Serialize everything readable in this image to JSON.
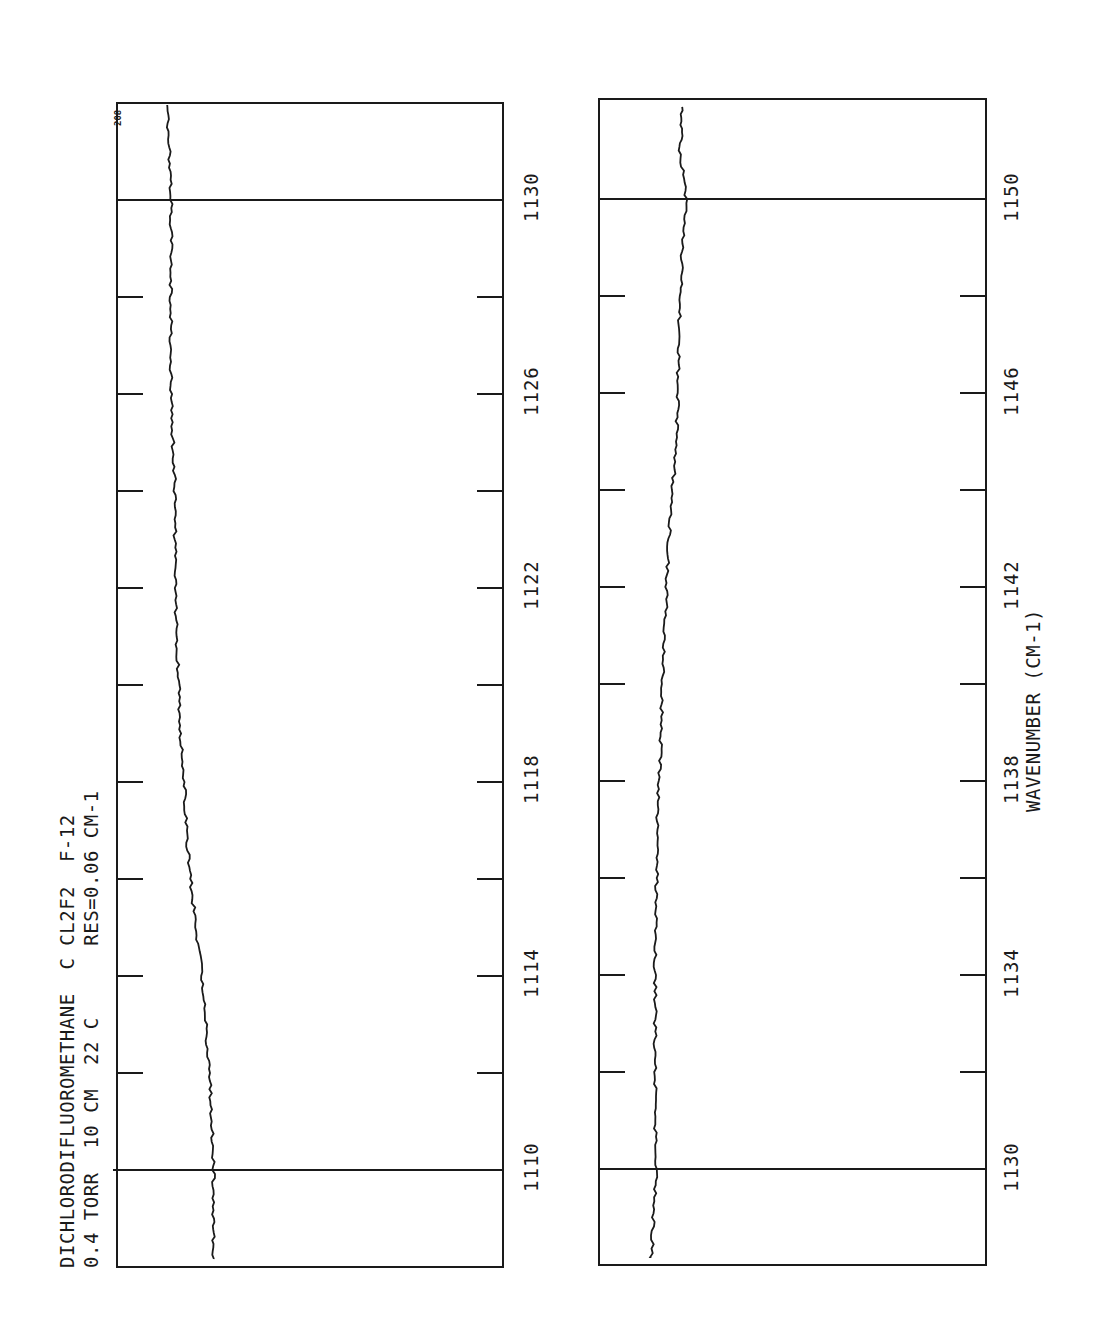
{
  "header": {
    "line1": "DICHLORODIFLUOROMETHANE  C CL2F2  F-12",
    "line2": "0.4 TORR  10 CM  22 C      RES=0.06 CM-1",
    "page_number": "208"
  },
  "axis": {
    "xlabel": "WAVENUMBER (CM-1)"
  },
  "panels": [
    {
      "range": [
        1110,
        1130
      ],
      "tick_labels": [
        "1110",
        "1114",
        "1118",
        "1122",
        "1126",
        "1130"
      ]
    },
    {
      "range": [
        1130,
        1150
      ],
      "tick_labels": [
        "1130",
        "1134",
        "1138",
        "1142",
        "1146",
        "1150"
      ]
    }
  ],
  "colors": {
    "ink": "#1a1a1a",
    "background": "#ffffff"
  },
  "chart_data": [
    {
      "type": "line",
      "title": "DICHLORODIFLUOROMETHANE C CL2F2 F-12 — 0.4 TORR 10 CM 22 C RES=0.06 CM-1",
      "xlabel": "WAVENUMBER (CM-1)",
      "ylabel": "Transmittance (relative)",
      "xlim": [
        1108.1,
        1132.0
      ],
      "ylim": [
        0,
        1
      ],
      "grid": false,
      "orientation": "rotated-90",
      "tick_labels": [
        "1110",
        "1114",
        "1118",
        "1122",
        "1126",
        "1130"
      ],
      "minor_tick_step": 2,
      "series": [
        {
          "name": "CCl2F2 transmittance",
          "x": [
            1108.1,
            1109,
            1110,
            1111,
            1112,
            1113,
            1114,
            1115,
            1116,
            1117,
            1118,
            1119,
            1120,
            1121,
            1122,
            1123,
            1124,
            1125,
            1126,
            1127,
            1128,
            1129,
            1130,
            1131,
            1132
          ],
          "values": [
            0.25,
            0.25,
            0.25,
            0.245,
            0.24,
            0.23,
            0.22,
            0.205,
            0.19,
            0.18,
            0.175,
            0.165,
            0.16,
            0.155,
            0.15,
            0.15,
            0.15,
            0.145,
            0.14,
            0.14,
            0.14,
            0.14,
            0.14,
            0.135,
            0.13
          ]
        }
      ]
    },
    {
      "type": "line",
      "title": "",
      "xlabel": "WAVENUMBER (CM-1)",
      "ylabel": "Transmittance (relative)",
      "xlim": [
        1127.9,
        1151.9
      ],
      "ylim": [
        0,
        1
      ],
      "grid": false,
      "orientation": "rotated-90",
      "tick_labels": [
        "1130",
        "1134",
        "1138",
        "1142",
        "1146",
        "1150"
      ],
      "minor_tick_step": 2,
      "series": [
        {
          "name": "CCl2F2 transmittance",
          "x": [
            1127.9,
            1129,
            1130,
            1131,
            1132,
            1133,
            1134,
            1135,
            1136,
            1137,
            1138,
            1139,
            1140,
            1141,
            1142,
            1143,
            1144,
            1145,
            1146,
            1147,
            1148,
            1149,
            1150,
            1151,
            1151.9
          ],
          "values": [
            0.135,
            0.14,
            0.15,
            0.145,
            0.145,
            0.145,
            0.145,
            0.145,
            0.15,
            0.15,
            0.155,
            0.16,
            0.165,
            0.17,
            0.175,
            0.18,
            0.19,
            0.2,
            0.205,
            0.205,
            0.21,
            0.215,
            0.225,
            0.21,
            0.215
          ]
        }
      ]
    }
  ]
}
